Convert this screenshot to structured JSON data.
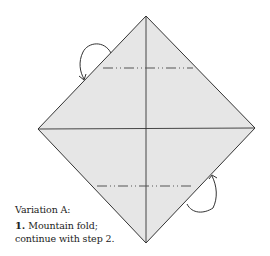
{
  "diagram": {
    "kind": "origami-instruction",
    "paper_color": "#e6e6e6",
    "line_color": "#333333",
    "fold_lines": [
      {
        "type": "mountain-fold",
        "position": "upper",
        "label": "mountain fold line"
      },
      {
        "type": "mountain-fold",
        "position": "lower",
        "label": "mountain fold line"
      }
    ],
    "arrows": [
      {
        "type": "mountain-fold-arrow",
        "position": "upper-left"
      },
      {
        "type": "mountain-fold-arrow",
        "position": "lower-right"
      }
    ]
  },
  "caption": {
    "variation_title": "Variation A:",
    "step_number": "1.",
    "step_text_line1": "Mountain fold;",
    "step_text_line2": "continue with step 2."
  }
}
